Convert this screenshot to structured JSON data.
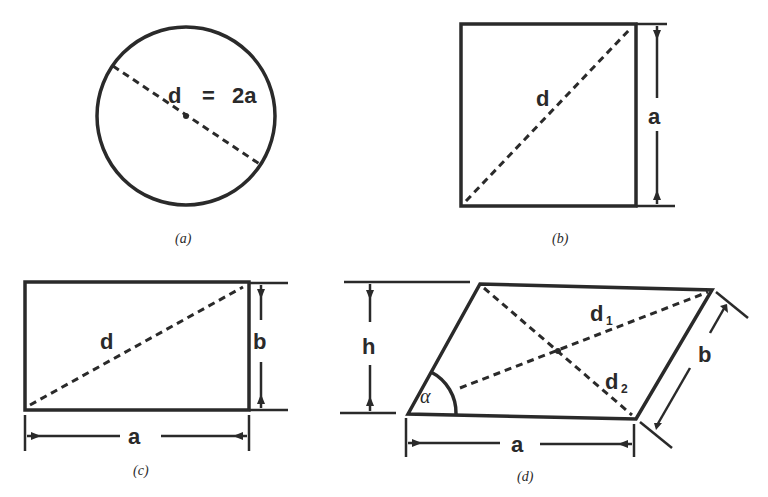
{
  "figures": {
    "a": {
      "caption": "(a)",
      "shape": "circle",
      "label_d": "d",
      "label_eq": "=",
      "label_2a": "2a"
    },
    "b": {
      "caption": "(b)",
      "shape": "square",
      "label_diagonal": "d",
      "label_side": "a"
    },
    "c": {
      "caption": "(c)",
      "shape": "rectangle",
      "label_diagonal": "d",
      "label_height": "b",
      "label_width": "a"
    },
    "d": {
      "caption": "(d)",
      "shape": "parallelogram",
      "label_height": "h",
      "label_angle": "α",
      "label_d1": "d",
      "label_d1_sub": "1",
      "label_d2": "d",
      "label_d2_sub": "2",
      "label_side_b": "b",
      "label_base": "a"
    }
  },
  "colors": {
    "ink": "#2a2a2a",
    "background": "#ffffff"
  }
}
